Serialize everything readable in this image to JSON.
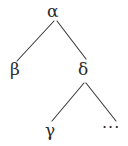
{
  "figure": {
    "kind": "syntax-tree-diagram",
    "background_color": "#ffffff",
    "stroke_color": "#3a3a3a",
    "text_color": "#2b2b2b",
    "width": 128,
    "height": 146
  },
  "nodes": {
    "root": {
      "id": "alpha",
      "label": "α",
      "x": 55,
      "y": 12
    },
    "child_left": {
      "id": "beta",
      "label": "β",
      "x": 16,
      "y": 70
    },
    "child_right": {
      "id": "delta",
      "label": "δ",
      "x": 85,
      "y": 70
    },
    "grandchild_left": {
      "id": "gamma",
      "label": "γ",
      "x": 52,
      "y": 131
    },
    "grandchild_right": {
      "id": "ellipsis",
      "label": "···",
      "x": 113,
      "y": 131
    }
  },
  "edges": [
    {
      "id": "alpha-beta",
      "from": "alpha",
      "to": "beta",
      "x1": 54,
      "y1": 21,
      "x2": 17,
      "y2": 61
    },
    {
      "id": "alpha-delta",
      "from": "alpha",
      "to": "delta",
      "x1": 57,
      "y1": 21,
      "x2": 86,
      "y2": 59
    },
    {
      "id": "delta-gamma",
      "from": "delta",
      "to": "gamma",
      "x1": 84,
      "y1": 83,
      "x2": 52,
      "y2": 121
    },
    {
      "id": "delta-ellipsis",
      "from": "delta",
      "to": "ellipsis",
      "x1": 86,
      "y1": 83,
      "x2": 116,
      "y2": 121
    }
  ]
}
